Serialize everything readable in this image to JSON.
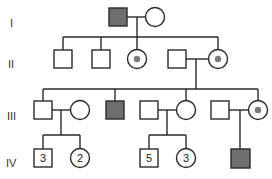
{
  "diagram": {
    "type": "pedigree",
    "colors": {
      "line": "#2a2a2a",
      "affected_fill": "#6e6e6e",
      "carrier_dot": "#7a7a7a",
      "background": "#ffffff"
    },
    "generations": [
      {
        "label": "I"
      },
      {
        "label": "II"
      },
      {
        "label": "III"
      },
      {
        "label": "IV"
      }
    ],
    "individuals": [
      {
        "id": "I-1",
        "sex": "male",
        "status": "affected"
      },
      {
        "id": "I-2",
        "sex": "female",
        "status": "unaffected"
      },
      {
        "id": "II-1",
        "sex": "male",
        "status": "unaffected"
      },
      {
        "id": "II-2",
        "sex": "male",
        "status": "unaffected"
      },
      {
        "id": "II-3",
        "sex": "female",
        "status": "carrier"
      },
      {
        "id": "II-4",
        "sex": "male",
        "status": "unaffected"
      },
      {
        "id": "II-5",
        "sex": "female",
        "status": "carrier"
      },
      {
        "id": "III-1",
        "sex": "male",
        "status": "unaffected"
      },
      {
        "id": "III-2",
        "sex": "female",
        "status": "unaffected"
      },
      {
        "id": "III-3",
        "sex": "male",
        "status": "affected"
      },
      {
        "id": "III-4",
        "sex": "male",
        "status": "unaffected"
      },
      {
        "id": "III-5",
        "sex": "female",
        "status": "unaffected"
      },
      {
        "id": "III-6",
        "sex": "male",
        "status": "unaffected"
      },
      {
        "id": "III-7",
        "sex": "female",
        "status": "carrier"
      },
      {
        "id": "IV-1",
        "sex": "male",
        "status": "unaffected",
        "count": "3"
      },
      {
        "id": "IV-2",
        "sex": "female",
        "status": "unaffected",
        "count": "2"
      },
      {
        "id": "IV-3",
        "sex": "male",
        "status": "unaffected",
        "count": "5"
      },
      {
        "id": "IV-4",
        "sex": "female",
        "status": "unaffected",
        "count": "3"
      },
      {
        "id": "IV-5",
        "sex": "male",
        "status": "affected"
      }
    ]
  }
}
